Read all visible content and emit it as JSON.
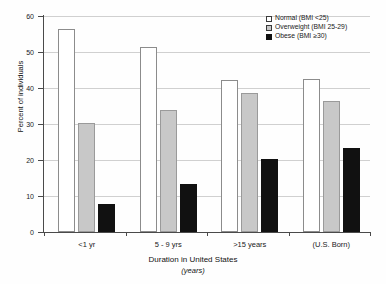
{
  "chart_data": {
    "type": "bar",
    "title": "",
    "xlabel": "Duration in United States",
    "xlabel_sub": "(years)",
    "ylabel": "Percent of individuals",
    "ylim": [
      0,
      60
    ],
    "yticks": [
      0,
      10,
      20,
      30,
      40,
      50,
      60
    ],
    "ytick_labels": [
      "0",
      "10",
      "20",
      "30",
      "40",
      "50",
      "60"
    ],
    "grid": true,
    "legend_position": "top-right",
    "categories": [
      "<1 yr",
      "5 - 9 yrs",
      ">15 years",
      "(U.S. Born)"
    ],
    "series": [
      {
        "name": "Normal (BMI <25)",
        "color": "#ffffff",
        "values": [
          56.5,
          51.5,
          42.3,
          42.4
        ]
      },
      {
        "name": "Overweight (BMI 25-29)",
        "color": "#c8c8c8",
        "values": [
          30.3,
          34.0,
          38.7,
          36.3
        ]
      },
      {
        "name": "Obese (BMI ≥30)",
        "color": "#111111",
        "values": [
          7.8,
          13.2,
          20.2,
          23.3
        ]
      }
    ]
  },
  "legend": {
    "items": [
      {
        "label": "Normal (BMI <25)",
        "swatch": "normal"
      },
      {
        "label": "Overweight (BMI 25-29)",
        "swatch": "overweight"
      },
      {
        "label": "Obese (BMI ≥30)",
        "swatch": "obese"
      }
    ]
  }
}
